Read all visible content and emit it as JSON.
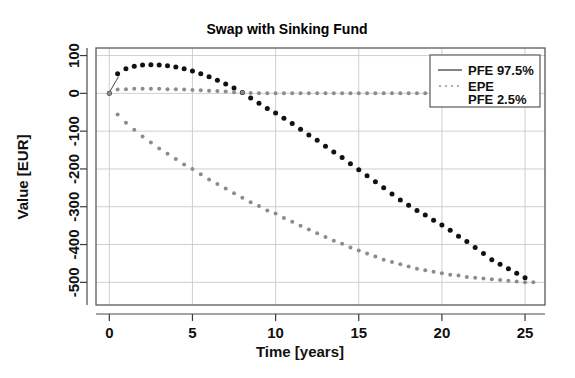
{
  "chart_data": {
    "type": "scatter",
    "title": "Swap with Sinking Fund",
    "xlabel": "Time [years]",
    "ylabel": "Value [EUR]",
    "xlim": [
      -0.8,
      26.2
    ],
    "ylim": [
      -560,
      120
    ],
    "xticks": [
      0,
      5,
      10,
      15,
      20,
      25
    ],
    "yticks": [
      100,
      0,
      -100,
      -200,
      -300,
      -400,
      -500
    ],
    "xtick_labels": [
      "0",
      "5",
      "10",
      "15",
      "20",
      "25"
    ],
    "ytick_labels": [
      "100",
      "0",
      "-100",
      "-200",
      "-300",
      "-400",
      "-500"
    ],
    "grid": true,
    "legend_position": "top-right",
    "series": [
      {
        "name": "PFE 97.5%",
        "marker": "dot",
        "color": "#111111",
        "x": [
          0.0,
          0.5,
          1.0,
          1.5,
          2.0,
          2.5,
          3.0,
          3.5,
          4.0,
          4.5,
          5.0,
          5.5,
          6.0,
          6.5,
          7.0,
          7.5,
          8.0,
          8.5,
          9.0,
          9.5,
          10.0,
          10.5,
          11.0,
          11.5,
          12.0,
          12.5,
          13.0,
          13.5,
          14.0,
          14.5,
          15.0,
          15.5,
          16.0,
          16.5,
          17.0,
          17.5,
          18.0,
          18.5,
          19.0,
          19.5,
          20.0,
          20.5,
          21.0,
          21.5,
          22.0,
          22.5,
          23.0,
          23.5,
          24.0,
          24.5,
          25.0
        ],
        "y": [
          0,
          52,
          65,
          72,
          75,
          76,
          75,
          73,
          70,
          65,
          59,
          52,
          44,
          35,
          25,
          14,
          2,
          -12,
          -26,
          -40,
          -52,
          -66,
          -80,
          -95,
          -110,
          -124,
          -140,
          -155,
          -170,
          -186,
          -202,
          -218,
          -234,
          -250,
          -266,
          -282,
          -296,
          -310,
          -322,
          -336,
          -348,
          -362,
          -378,
          -392,
          -408,
          -424,
          -440,
          -452,
          -464,
          -476,
          -488
        ]
      },
      {
        "name": "EPE",
        "marker": "dot",
        "color": "#8c8c8c",
        "x": [
          0.0,
          0.5,
          1.0,
          1.5,
          2.0,
          2.5,
          3.0,
          3.5,
          4.0,
          4.5,
          5.0,
          5.5,
          6.0,
          6.5,
          7.0,
          7.5,
          8.0,
          8.5,
          9.0,
          9.5,
          10.0,
          10.5,
          11.0,
          11.5,
          12.0,
          12.5,
          13.0,
          13.5,
          14.0,
          14.5,
          15.0,
          15.5,
          16.0,
          16.5,
          17.0,
          17.5,
          18.0,
          18.5,
          19.0,
          19.5,
          20.0,
          20.5,
          21.0,
          21.5,
          22.0,
          22.5,
          23.0,
          23.5,
          24.0,
          24.5,
          25.0,
          25.5
        ],
        "y": [
          0,
          10,
          11,
          12,
          12,
          12,
          12,
          11,
          11,
          10,
          9,
          8,
          7,
          6,
          5,
          3,
          2,
          1,
          0,
          0,
          0,
          0,
          0,
          0,
          0,
          0,
          0,
          0,
          0,
          0,
          0,
          0,
          0,
          0,
          0,
          0,
          0,
          0,
          0,
          0,
          0,
          0,
          0,
          0,
          0,
          0,
          0,
          0,
          0,
          0,
          0,
          0
        ]
      },
      {
        "name": "PFE 2.5%",
        "marker": "dot",
        "color": "#8c8c8c",
        "x": [
          0.0,
          0.5,
          1.0,
          1.5,
          2.0,
          2.5,
          3.0,
          3.5,
          4.0,
          4.5,
          5.0,
          5.5,
          6.0,
          6.5,
          7.0,
          7.5,
          8.0,
          8.5,
          9.0,
          9.5,
          10.0,
          10.5,
          11.0,
          11.5,
          12.0,
          12.5,
          13.0,
          13.5,
          14.0,
          14.5,
          15.0,
          15.5,
          16.0,
          16.5,
          17.0,
          17.5,
          18.0,
          18.5,
          19.0,
          19.5,
          20.0,
          20.5,
          21.0,
          21.5,
          22.0,
          22.5,
          23.0,
          23.5,
          24.0,
          24.5,
          25.0,
          25.5
        ],
        "y": [
          0,
          -56,
          -78,
          -96,
          -114,
          -130,
          -146,
          -160,
          -174,
          -188,
          -200,
          -214,
          -228,
          -240,
          -252,
          -264,
          -276,
          -288,
          -298,
          -310,
          -318,
          -330,
          -340,
          -350,
          -360,
          -370,
          -380,
          -390,
          -398,
          -408,
          -416,
          -424,
          -432,
          -440,
          -446,
          -452,
          -458,
          -464,
          -468,
          -472,
          -476,
          -480,
          -482,
          -486,
          -488,
          -490,
          -492,
          -494,
          -496,
          -498,
          -500,
          -500
        ]
      }
    ]
  },
  "legend": {
    "entries": [
      {
        "label": "PFE 97.5%",
        "style": "solid-line"
      },
      {
        "label": "EPE",
        "style": "dotted-line"
      },
      {
        "label": "PFE 2.5%",
        "style": "none"
      }
    ]
  },
  "colors": {
    "series_dark": "#111111",
    "series_gray": "#8c8c8c",
    "grid": "#c9c9c9",
    "frame": "#5a5a5a",
    "background": "#ffffff"
  }
}
